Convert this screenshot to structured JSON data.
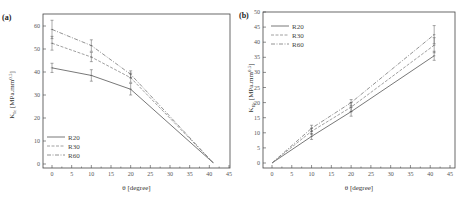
{
  "chart_data": [
    {
      "panel": "(a)",
      "type": "line",
      "title": "",
      "xlabel": "θ [degree]",
      "ylabel": "K_Ic [MPa.mm^0.5]",
      "xlim": [
        -2,
        45
      ],
      "ylim": [
        -1,
        64
      ],
      "xticks": [
        0,
        5,
        10,
        15,
        20,
        25,
        30,
        35,
        40,
        45
      ],
      "yticks": [
        0,
        10,
        20,
        30,
        40,
        50,
        60
      ],
      "grid": false,
      "legend_position": "lower left",
      "x": [
        0,
        10,
        20,
        41
      ],
      "series": [
        {
          "name": "R20",
          "style": "solid",
          "values": [
            41.8,
            38.5,
            32.5,
            0.5
          ],
          "errors": [
            2.0,
            2.5,
            2.5,
            0
          ]
        },
        {
          "name": "R30",
          "style": "dashed",
          "values": [
            52.5,
            46.5,
            37.5,
            0.5
          ],
          "errors": [
            3.0,
            2.0,
            2.0,
            0
          ]
        },
        {
          "name": "R60",
          "style": "dashdot",
          "values": [
            58.5,
            51.5,
            39.0,
            0.5
          ],
          "errors": [
            4.0,
            2.5,
            1.5,
            0
          ]
        }
      ]
    },
    {
      "panel": "(b)",
      "type": "line",
      "title": "",
      "xlabel": "θ [degree]",
      "ylabel": "K_IIc [MPa.mm^0.5]",
      "xlim": [
        -2,
        45
      ],
      "ylim": [
        -1,
        50
      ],
      "xticks": [
        0,
        5,
        10,
        15,
        20,
        25,
        30,
        35,
        40,
        45
      ],
      "yticks": [
        0,
        5,
        10,
        15,
        20,
        25,
        30,
        35,
        40,
        45,
        50
      ],
      "grid": false,
      "legend_position": "upper left",
      "x": [
        0,
        10,
        20,
        41
      ],
      "series": [
        {
          "name": "R20",
          "style": "solid",
          "values": [
            0,
            8.8,
            17.0,
            35.5
          ],
          "errors": [
            0,
            1.0,
            1.5,
            1.5
          ]
        },
        {
          "name": "R30",
          "style": "dashed",
          "values": [
            0,
            10.5,
            18.5,
            39.0
          ],
          "errors": [
            0,
            1.0,
            1.5,
            2.5
          ]
        },
        {
          "name": "R60",
          "style": "dashdot",
          "values": [
            0,
            11.5,
            20.0,
            42.5
          ],
          "errors": [
            0,
            1.0,
            1.0,
            3.0
          ]
        }
      ]
    }
  ],
  "panels": {
    "a": {
      "label": "(a)",
      "ylabel_main": "K",
      "ylabel_sub": "Ic",
      "ylabel_rest": " [MPa.mm",
      "ylabel_sup": "0.5",
      "ylabel_end": "]",
      "xlabel": "θ [degree]"
    },
    "b": {
      "label": "(b)",
      "ylabel_main": "K",
      "ylabel_sub": "IIc",
      "ylabel_rest": " [MPa.mm",
      "ylabel_sup": "0.5",
      "ylabel_end": "]",
      "xlabel": "θ [degree]"
    }
  },
  "legend": [
    "R20",
    "R30",
    "R60"
  ],
  "colors": {
    "R20": "#555555",
    "R30": "#888888",
    "R60": "#777777",
    "axis": "#444444"
  }
}
